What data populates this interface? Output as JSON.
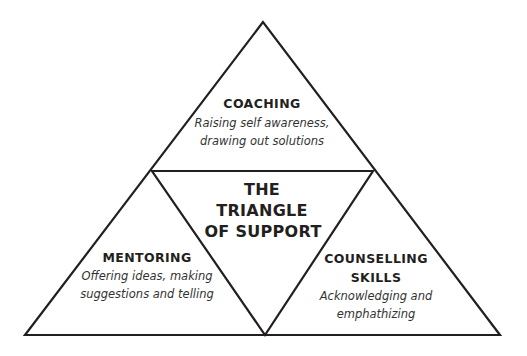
{
  "diagram": {
    "title_lines": [
      "THE",
      "TRIANGLE",
      "OF SUPPORT"
    ],
    "line_color": "#231f20",
    "sections": {
      "coaching": {
        "heading": "COACHING",
        "description_lines": [
          "Raising self awareness,",
          "drawing out solutions"
        ]
      },
      "mentoring": {
        "heading": "MENTORING",
        "description_lines": [
          "Offering ideas, making",
          "suggestions and telling"
        ]
      },
      "counselling": {
        "heading_lines": [
          "COUNSELLING",
          "SKILLS"
        ],
        "description_lines": [
          "Acknowledging and",
          "emphathizing"
        ]
      }
    }
  }
}
